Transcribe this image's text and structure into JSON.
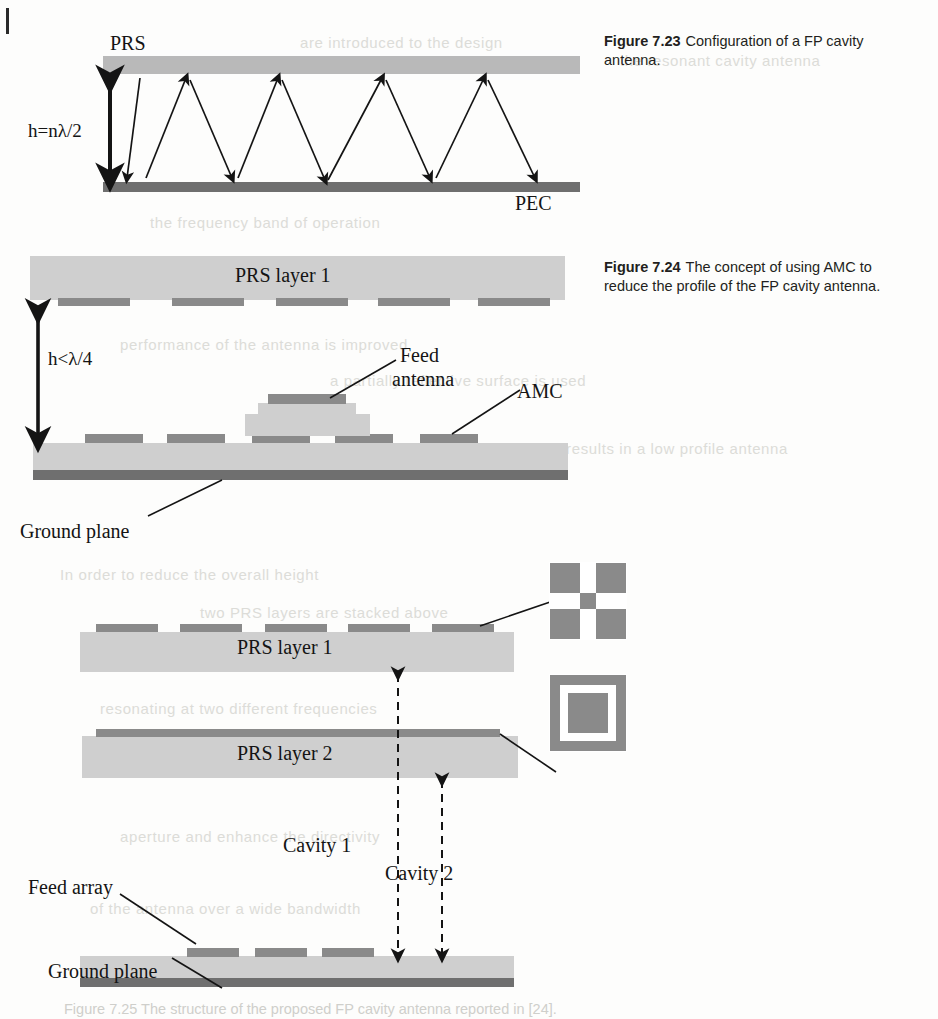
{
  "page": {
    "edge_mark": "page-edge-rule"
  },
  "ghost_text": [
    {
      "t": "are introduced to the design",
      "x": 300,
      "y": 34
    },
    {
      "t": "the resonant cavity antenna",
      "x": 620,
      "y": 52
    },
    {
      "t": "the frequency band of operation",
      "x": 150,
      "y": 214
    },
    {
      "t": "performance of the antenna is improved",
      "x": 120,
      "y": 336
    },
    {
      "t": "a partially reflective surface is used",
      "x": 330,
      "y": 372
    },
    {
      "t": "which results in a low profile antenna",
      "x": 520,
      "y": 440
    },
    {
      "t": "In order to reduce the overall height",
      "x": 60,
      "y": 566
    },
    {
      "t": "two PRS layers are stacked above",
      "x": 200,
      "y": 604
    },
    {
      "t": "the ground plane to form two cavities",
      "x": 240,
      "y": 648
    },
    {
      "t": "resonating at two different frequencies",
      "x": 100,
      "y": 700
    },
    {
      "t": "both cavities contribute to the radiation",
      "x": 160,
      "y": 760
    },
    {
      "t": "aperture and enhance the directivity",
      "x": 120,
      "y": 828
    },
    {
      "t": "of the antenna over a wide bandwidth",
      "x": 90,
      "y": 900
    }
  ],
  "figures": [
    {
      "id": "figure-7-23",
      "caption_number": "Figure 7.23",
      "caption_text": "Configuration of a FP cavity antenna.",
      "labels": {
        "prs": "PRS",
        "pec": "PEC",
        "height": "h=nλ/2"
      }
    },
    {
      "id": "figure-7-24",
      "caption_number": "Figure 7.24",
      "caption_text": "The concept of using AMC to reduce the profile of the FP cavity antenna.",
      "labels": {
        "prs_layer_1": "PRS layer 1",
        "height": "h<λ/4",
        "feed_antenna_line1": "Feed",
        "feed_antenna_line2": "antenna",
        "amc": "AMC",
        "ground_plane": "Ground plane"
      }
    },
    {
      "id": "figure-7-25",
      "caption_number": "Figure 7.25",
      "caption_text": "The structure of the proposed FP cavity antenna reported in [24].",
      "caption_full": "Figure 7.25 The structure of the proposed FP cavity antenna reported in [24].",
      "labels": {
        "prs_layer_1": "PRS layer 1",
        "prs_layer_2": "PRS layer 2",
        "cavity_1": "Cavity 1",
        "cavity_2": "Cavity 2",
        "feed_array": "Feed array",
        "ground_plane": "Ground plane"
      },
      "insets": [
        {
          "name": "cross-patch-unit-cell"
        },
        {
          "name": "square-ring-patch-unit-cell"
        }
      ]
    }
  ],
  "colors": {
    "slab_fill": "#b9b9b9",
    "slab_fill_light": "#cfcfcf",
    "patch_fill": "#8a8a8a",
    "pec_fill": "#6f6f6f",
    "ink": "#141414",
    "caption_ink": "#231f20"
  }
}
